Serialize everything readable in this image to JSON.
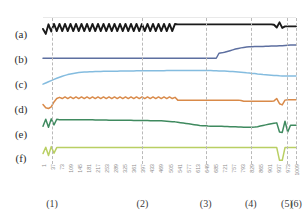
{
  "chart_data": {
    "type": "line",
    "title": "",
    "xlabel": "",
    "ylabel": "",
    "grid": false,
    "legend_position": "left",
    "xlim": [
      1,
      1009
    ],
    "x_tick_labels": [
      "1",
      "37",
      "73",
      "109",
      "145",
      "181",
      "217",
      "253",
      "289",
      "325",
      "361",
      "397",
      "433",
      "469",
      "505",
      "541",
      "577",
      "613",
      "649",
      "685",
      "721",
      "757",
      "793",
      "829",
      "865",
      "901",
      "937",
      "973",
      "1009"
    ],
    "event_markers": [
      {
        "label": "(1)",
        "x": 37
      },
      {
        "label": "(2)",
        "x": 397
      },
      {
        "label": "(3)",
        "x": 649
      },
      {
        "label": "(4)",
        "x": 829
      },
      {
        "label": "(5)",
        "x": 973
      },
      {
        "label": "(6)",
        "x": 1009
      }
    ],
    "panels": [
      {
        "label": "(a)",
        "color": "#1a1a1a",
        "description": "oscillating sawtooth until (2), then flat high, small dip-spike near (5)",
        "values": [
          0.55,
          0.3,
          0.78,
          0.42,
          0.8,
          0.44,
          0.8,
          0.44,
          0.8,
          0.44,
          0.8,
          0.44,
          0.8,
          0.44,
          0.8,
          0.44,
          0.8,
          0.44,
          0.8,
          0.44,
          0.8,
          0.44,
          0.8,
          0.44,
          0.8,
          0.44,
          0.8,
          0.44,
          0.8,
          0.44,
          0.8,
          0.44,
          0.8,
          0.44,
          0.8,
          0.44,
          0.8,
          0.44,
          0.8,
          0.44,
          0.8,
          0.44,
          0.8,
          0.44,
          0.8,
          0.44,
          0.8,
          0.44,
          0.8,
          0.78,
          0.78,
          0.78,
          0.78,
          0.78,
          0.78,
          0.78,
          0.78,
          0.78,
          0.78,
          0.78,
          0.78,
          0.78,
          0.78,
          0.78,
          0.78,
          0.78,
          0.78,
          0.78,
          0.78,
          0.78,
          0.78,
          0.78,
          0.78,
          0.78,
          0.78,
          0.78,
          0.78,
          0.78,
          0.78,
          0.78,
          0.78,
          0.78,
          0.78,
          0.78,
          0.76,
          0.62,
          0.88,
          0.6,
          0.68,
          0.68,
          0.68,
          0.68,
          0.68
        ]
      },
      {
        "label": "(b)",
        "color": "#5d6fa0",
        "description": "flat low, step jump at (3), gradual rise to high plateau",
        "values": [
          0.3,
          0.3,
          0.3,
          0.3,
          0.3,
          0.3,
          0.3,
          0.3,
          0.3,
          0.3,
          0.3,
          0.3,
          0.3,
          0.3,
          0.3,
          0.3,
          0.3,
          0.3,
          0.3,
          0.3,
          0.3,
          0.3,
          0.3,
          0.3,
          0.3,
          0.3,
          0.3,
          0.3,
          0.3,
          0.3,
          0.3,
          0.3,
          0.3,
          0.3,
          0.3,
          0.3,
          0.3,
          0.3,
          0.3,
          0.3,
          0.3,
          0.3,
          0.3,
          0.3,
          0.3,
          0.3,
          0.3,
          0.3,
          0.3,
          0.3,
          0.3,
          0.3,
          0.3,
          0.3,
          0.3,
          0.3,
          0.3,
          0.3,
          0.3,
          0.3,
          0.3,
          0.3,
          0.3,
          0.3,
          0.55,
          0.57,
          0.6,
          0.64,
          0.68,
          0.72,
          0.76,
          0.79,
          0.82,
          0.84,
          0.86,
          0.87,
          0.88,
          0.885,
          0.89,
          0.89,
          0.895,
          0.9,
          0.905,
          0.91,
          0.915,
          0.92,
          0.925,
          0.93,
          0.94,
          0.95,
          0.96,
          0.96,
          0.96
        ]
      },
      {
        "label": "(c)",
        "color": "#84bcdf",
        "description": "rises from low-left to broad plateau, slow decline after (4)",
        "values": [
          0.22,
          0.28,
          0.34,
          0.4,
          0.46,
          0.52,
          0.57,
          0.62,
          0.66,
          0.7,
          0.73,
          0.76,
          0.78,
          0.8,
          0.815,
          0.825,
          0.835,
          0.84,
          0.845,
          0.85,
          0.855,
          0.86,
          0.862,
          0.865,
          0.868,
          0.87,
          0.872,
          0.874,
          0.876,
          0.878,
          0.88,
          0.882,
          0.884,
          0.886,
          0.888,
          0.89,
          0.891,
          0.892,
          0.893,
          0.894,
          0.895,
          0.896,
          0.897,
          0.898,
          0.899,
          0.9,
          0.9,
          0.9,
          0.9,
          0.9,
          0.9,
          0.9,
          0.9,
          0.9,
          0.9,
          0.9,
          0.9,
          0.9,
          0.9,
          0.9,
          0.9,
          0.9,
          0.895,
          0.89,
          0.885,
          0.88,
          0.875,
          0.87,
          0.86,
          0.85,
          0.84,
          0.83,
          0.82,
          0.81,
          0.79,
          0.78,
          0.76,
          0.75,
          0.73,
          0.72,
          0.7,
          0.69,
          0.68,
          0.67,
          0.66,
          0.65,
          0.64,
          0.635,
          0.63,
          0.63,
          0.63,
          0.63,
          0.63
        ]
      },
      {
        "label": "(d)",
        "color": "#d98a49",
        "description": "dip then rise, square oscillation until (2), flat, step down, dip-spike near (5)",
        "values": [
          0.42,
          0.26,
          0.22,
          0.3,
          0.55,
          0.72,
          0.78,
          0.72,
          0.8,
          0.72,
          0.8,
          0.72,
          0.8,
          0.72,
          0.8,
          0.72,
          0.8,
          0.72,
          0.8,
          0.72,
          0.8,
          0.72,
          0.8,
          0.72,
          0.8,
          0.72,
          0.8,
          0.72,
          0.8,
          0.72,
          0.8,
          0.72,
          0.8,
          0.72,
          0.8,
          0.72,
          0.8,
          0.72,
          0.8,
          0.72,
          0.8,
          0.72,
          0.8,
          0.72,
          0.8,
          0.72,
          0.8,
          0.72,
          0.78,
          0.64,
          0.64,
          0.64,
          0.64,
          0.64,
          0.64,
          0.64,
          0.64,
          0.64,
          0.64,
          0.64,
          0.64,
          0.64,
          0.64,
          0.64,
          0.64,
          0.64,
          0.64,
          0.64,
          0.64,
          0.64,
          0.64,
          0.64,
          0.62,
          0.58,
          0.58,
          0.58,
          0.58,
          0.58,
          0.58,
          0.58,
          0.58,
          0.58,
          0.58,
          0.58,
          0.6,
          0.72,
          0.46,
          0.4,
          0.64,
          0.66,
          0.66,
          0.66,
          0.66
        ]
      },
      {
        "label": "(e)",
        "color": "#3f8a5f",
        "description": "left spike cluster, high plateau, slow decline to trough, rise, sharp dip-spike-dip at (5)/(6)",
        "values": [
          0.55,
          0.9,
          0.5,
          0.92,
          0.62,
          0.9,
          0.88,
          0.88,
          0.88,
          0.88,
          0.88,
          0.88,
          0.88,
          0.88,
          0.87,
          0.87,
          0.87,
          0.87,
          0.87,
          0.86,
          0.86,
          0.86,
          0.86,
          0.86,
          0.85,
          0.85,
          0.85,
          0.85,
          0.85,
          0.85,
          0.85,
          0.85,
          0.85,
          0.84,
          0.84,
          0.84,
          0.84,
          0.84,
          0.84,
          0.83,
          0.83,
          0.83,
          0.82,
          0.82,
          0.81,
          0.8,
          0.79,
          0.78,
          0.77,
          0.75,
          0.73,
          0.71,
          0.69,
          0.67,
          0.65,
          0.63,
          0.61,
          0.59,
          0.58,
          0.57,
          0.56,
          0.555,
          0.55,
          0.55,
          0.55,
          0.545,
          0.54,
          0.535,
          0.53,
          0.525,
          0.52,
          0.515,
          0.51,
          0.505,
          0.5,
          0.5,
          0.5,
          0.51,
          0.53,
          0.56,
          0.59,
          0.62,
          0.65,
          0.68,
          0.7,
          0.72,
          0.26,
          0.24,
          0.8,
          0.26,
          0.6,
          0.6,
          0.6
        ]
      },
      {
        "label": "(f)",
        "color": "#b9cf63",
        "description": "left spike cluster, completely flat, sharp deep dip at (5)",
        "values": [
          0.4,
          0.72,
          0.3,
          0.75,
          0.42,
          0.7,
          0.7,
          0.7,
          0.7,
          0.7,
          0.7,
          0.7,
          0.7,
          0.7,
          0.7,
          0.7,
          0.7,
          0.7,
          0.7,
          0.7,
          0.7,
          0.7,
          0.7,
          0.7,
          0.7,
          0.7,
          0.7,
          0.7,
          0.7,
          0.7,
          0.7,
          0.7,
          0.7,
          0.7,
          0.7,
          0.7,
          0.7,
          0.7,
          0.7,
          0.7,
          0.7,
          0.7,
          0.7,
          0.7,
          0.7,
          0.7,
          0.7,
          0.7,
          0.7,
          0.7,
          0.7,
          0.7,
          0.7,
          0.7,
          0.7,
          0.7,
          0.7,
          0.7,
          0.7,
          0.7,
          0.7,
          0.7,
          0.7,
          0.7,
          0.7,
          0.7,
          0.7,
          0.7,
          0.7,
          0.7,
          0.7,
          0.7,
          0.7,
          0.7,
          0.7,
          0.7,
          0.7,
          0.7,
          0.7,
          0.7,
          0.7,
          0.7,
          0.7,
          0.7,
          0.7,
          0.7,
          0.06,
          0.06,
          0.7,
          0.7,
          0.7,
          0.7,
          0.7
        ]
      }
    ]
  }
}
